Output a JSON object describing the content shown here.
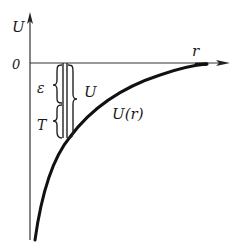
{
  "figure": {
    "type": "potential energy diagram",
    "axes": {
      "y_label": "U",
      "x_label": "r",
      "origin_label": "0"
    },
    "curve": {
      "label": "U(r)",
      "description": "attractive potential, approaches 0 as r increases, diverges to -infinity as r approaches 0"
    },
    "annotations": {
      "energy_label": "ε",
      "kinetic_label": "T",
      "potential_label": "U"
    }
  }
}
